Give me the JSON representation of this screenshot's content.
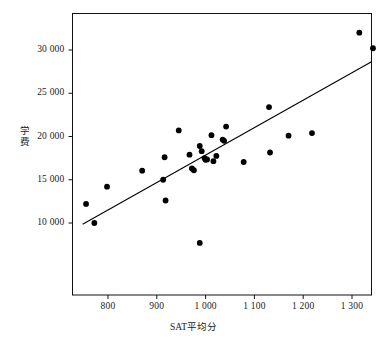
{
  "chart_data": {
    "type": "scatter",
    "title": "",
    "xlabel": "SAT平均分",
    "ylabel": "学费",
    "xlim": [
      740,
      1355
    ],
    "ylim": [
      7000,
      33300
    ],
    "grid": false,
    "legend": null,
    "x_ticks": [
      {
        "value": 800,
        "label": "800"
      },
      {
        "value": 900,
        "label": "900"
      },
      {
        "value": 1000,
        "label": "1 000"
      },
      {
        "value": 1100,
        "label": "1 100"
      },
      {
        "value": 1200,
        "label": "1 200"
      },
      {
        "value": 1300,
        "label": "1 300"
      }
    ],
    "y_ticks": [
      {
        "value": 10000,
        "label": "10 000"
      },
      {
        "value": 15000,
        "label": "15 000"
      },
      {
        "value": 20000,
        "label": "20 000"
      },
      {
        "value": 25000,
        "label": "25 000"
      },
      {
        "value": 30000,
        "label": "30 000"
      }
    ],
    "series": [
      {
        "name": "colleges",
        "marker": "circle",
        "color": "#000000",
        "points": [
          {
            "x": 755,
            "y": 12200
          },
          {
            "x": 772,
            "y": 10000
          },
          {
            "x": 798,
            "y": 14200
          },
          {
            "x": 870,
            "y": 16050
          },
          {
            "x": 913,
            "y": 15000
          },
          {
            "x": 916,
            "y": 17600
          },
          {
            "x": 918,
            "y": 12600
          },
          {
            "x": 945,
            "y": 20700
          },
          {
            "x": 967,
            "y": 17900
          },
          {
            "x": 972,
            "y": 16300
          },
          {
            "x": 976,
            "y": 16100
          },
          {
            "x": 988,
            "y": 7700
          },
          {
            "x": 988,
            "y": 18900
          },
          {
            "x": 992,
            "y": 18300
          },
          {
            "x": 998,
            "y": 17500
          },
          {
            "x": 1000,
            "y": 17300
          },
          {
            "x": 1003,
            "y": 17350
          },
          {
            "x": 1012,
            "y": 20150
          },
          {
            "x": 1016,
            "y": 17150
          },
          {
            "x": 1022,
            "y": 17750
          },
          {
            "x": 1035,
            "y": 19650
          },
          {
            "x": 1038,
            "y": 19500
          },
          {
            "x": 1042,
            "y": 21150
          },
          {
            "x": 1078,
            "y": 17050
          },
          {
            "x": 1130,
            "y": 23400
          },
          {
            "x": 1132,
            "y": 18150
          },
          {
            "x": 1170,
            "y": 20100
          },
          {
            "x": 1218,
            "y": 20400
          },
          {
            "x": 1315,
            "y": 32000
          },
          {
            "x": 1343,
            "y": 30200
          }
        ]
      }
    ],
    "fit_line": {
      "name": "least-squares-regression-line",
      "color": "#000000",
      "x1": 748,
      "y1": 9850,
      "x2": 1348,
      "y2": 28900
    }
  }
}
